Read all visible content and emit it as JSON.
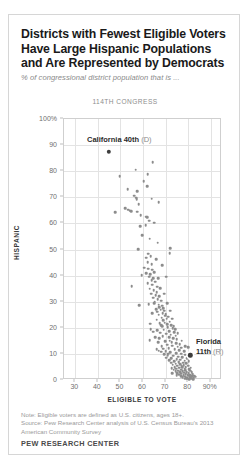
{
  "figure": {
    "title": "Districts with Fewest Eligible Voters Have Large Hispanic Populations and Are Represented by Democrats",
    "subtitle": "% of congressional district population that is ...",
    "panel_label": "114TH CONGRESS",
    "note": "Note: Eligible voters are defined as U.S. citizens, ages 18+.",
    "source": "Source: Pew Research Center analysis of U.S. Census Bureau's 2013 American Community Survey",
    "brand": "PEW RESEARCH CENTER",
    "colors": {
      "dot": "#8c8c8c",
      "highlight_dot": "#3d3d3d",
      "gridline": "#e3e3e3",
      "frame": "#cfcfcf",
      "title_text": "#1a1a1a",
      "muted_text": "#8a8a8a"
    }
  },
  "chart_data": {
    "type": "scatter",
    "title": "Districts with Fewest Eligible Voters Have Large Hispanic Populations and Are Represented by Democrats",
    "subtitle": "% of congressional district population that is ...",
    "panel_label": "114TH CONGRESS",
    "xlabel": "ELIGIBLE TO VOTE",
    "ylabel": "HISPANIC",
    "xlim": [
      25,
      95
    ],
    "ylim": [
      0,
      100
    ],
    "xticks": [
      30,
      40,
      50,
      60,
      70,
      80,
      90
    ],
    "xtick_labels": [
      "30",
      "40",
      "50",
      "60",
      "70",
      "80",
      "90%"
    ],
    "yticks": [
      0,
      10,
      20,
      30,
      40,
      50,
      60,
      70,
      80,
      90,
      100
    ],
    "ytick_labels": [
      "0",
      "10",
      "20",
      "30",
      "40",
      "50",
      "60",
      "70",
      "80",
      "90",
      "100%"
    ],
    "grid": true,
    "legend": null,
    "annotations": [
      {
        "name": "california-40th",
        "label_bold": "California 40th",
        "label_light": "(D)",
        "x": 44.8,
        "y": 87.5
      },
      {
        "name": "florida-11th",
        "label_line1_bold": "Florida",
        "label_line2_bold": "11th",
        "label_line2_light": "(R)",
        "x": 81.0,
        "y": 9.5
      }
    ],
    "points": [
      [
        44.8,
        87.5
      ],
      [
        64.3,
        83.5
      ],
      [
        56.8,
        80.6
      ],
      [
        49.6,
        78.1
      ],
      [
        62.0,
        78.8
      ],
      [
        60.3,
        76.2
      ],
      [
        61.8,
        74.2
      ],
      [
        53.3,
        73.0
      ],
      [
        57.4,
        72.3
      ],
      [
        56.2,
        70.6
      ],
      [
        56.9,
        69.9
      ],
      [
        57.2,
        69.2
      ],
      [
        63.8,
        69.5
      ],
      [
        67.0,
        68.1
      ],
      [
        58.1,
        67.3
      ],
      [
        52.0,
        65.8
      ],
      [
        53.4,
        65.2
      ],
      [
        54.4,
        64.9
      ],
      [
        54.8,
        64.6
      ],
      [
        57.5,
        64.5
      ],
      [
        47.8,
        64.2
      ],
      [
        59.0,
        63.2
      ],
      [
        61.5,
        62.6
      ],
      [
        61.9,
        62.4
      ],
      [
        62.7,
        61.0
      ],
      [
        64.9,
        60.3
      ],
      [
        58.8,
        59.0
      ],
      [
        61.2,
        59.2
      ],
      [
        59.6,
        55.5
      ],
      [
        62.9,
        54.2
      ],
      [
        66.5,
        52.6
      ],
      [
        57.9,
        50.1
      ],
      [
        72.0,
        50.4
      ],
      [
        71.8,
        48.6
      ],
      [
        62.2,
        48.4
      ],
      [
        63.5,
        47.5
      ],
      [
        61.4,
        46.8
      ],
      [
        65.9,
        46.2
      ],
      [
        62.0,
        45.1
      ],
      [
        63.9,
        44.4
      ],
      [
        68.6,
        44.0
      ],
      [
        60.6,
        43.0
      ],
      [
        62.4,
        42.7
      ],
      [
        64.2,
        42.2
      ],
      [
        65.0,
        41.4
      ],
      [
        61.3,
        41.0
      ],
      [
        63.2,
        40.6
      ],
      [
        59.5,
        40.2
      ],
      [
        62.7,
        39.5
      ],
      [
        64.6,
        39.1
      ],
      [
        70.2,
        39.6
      ],
      [
        66.8,
        38.9
      ],
      [
        63.8,
        38.2
      ],
      [
        65.4,
        37.6
      ],
      [
        62.1,
        37.2
      ],
      [
        64.0,
        36.5
      ],
      [
        55.0,
        36.0
      ],
      [
        66.2,
        35.8
      ],
      [
        67.5,
        35.2
      ],
      [
        63.0,
        35.0
      ],
      [
        64.8,
        34.4
      ],
      [
        66.0,
        33.7
      ],
      [
        63.6,
        33.1
      ],
      [
        65.7,
        32.6
      ],
      [
        67.1,
        32.0
      ],
      [
        64.4,
        31.5
      ],
      [
        66.6,
        30.9
      ],
      [
        68.0,
        30.4
      ],
      [
        65.2,
        30.0
      ],
      [
        58.4,
        28.6
      ],
      [
        66.9,
        28.8
      ],
      [
        68.4,
        28.4
      ],
      [
        67.3,
        28.0
      ],
      [
        69.0,
        27.6
      ],
      [
        65.8,
        27.2
      ],
      [
        67.8,
        26.9
      ],
      [
        69.4,
        26.5
      ],
      [
        66.4,
        26.1
      ],
      [
        68.7,
        25.7
      ],
      [
        70.0,
        25.3
      ],
      [
        67.0,
        25.0
      ],
      [
        69.8,
        24.6
      ],
      [
        71.2,
        24.2
      ],
      [
        68.2,
        23.9
      ],
      [
        70.5,
        23.5
      ],
      [
        66.1,
        23.1
      ],
      [
        68.9,
        22.8
      ],
      [
        71.8,
        22.4
      ],
      [
        69.6,
        22.0
      ],
      [
        67.4,
        21.7
      ],
      [
        70.8,
        21.3
      ],
      [
        72.5,
        21.0
      ],
      [
        68.5,
        20.6
      ],
      [
        71.0,
        20.2
      ],
      [
        73.2,
        19.9
      ],
      [
        63.5,
        19.5
      ],
      [
        69.2,
        19.2
      ],
      [
        71.5,
        18.8
      ],
      [
        73.8,
        18.4
      ],
      [
        67.6,
        18.1
      ],
      [
        70.3,
        17.7
      ],
      [
        72.2,
        17.4
      ],
      [
        74.4,
        17.0
      ],
      [
        68.8,
        16.7
      ],
      [
        71.7,
        16.3
      ],
      [
        73.5,
        16.0
      ],
      [
        75.0,
        15.6
      ],
      [
        62.9,
        15.2
      ],
      [
        69.9,
        14.9
      ],
      [
        72.8,
        14.5
      ],
      [
        74.8,
        14.2
      ],
      [
        76.2,
        13.8
      ],
      [
        70.6,
        13.5
      ],
      [
        73.0,
        13.1
      ],
      [
        75.4,
        12.8
      ],
      [
        77.0,
        12.4
      ],
      [
        71.4,
        12.1
      ],
      [
        74.0,
        11.8
      ],
      [
        76.0,
        11.4
      ],
      [
        78.2,
        11.1
      ],
      [
        66.0,
        11.8
      ],
      [
        67.0,
        11.2
      ],
      [
        68.0,
        10.9
      ],
      [
        72.0,
        10.6
      ],
      [
        74.6,
        10.3
      ],
      [
        76.8,
        10.0
      ],
      [
        78.8,
        9.7
      ],
      [
        81.0,
        9.5
      ],
      [
        69.5,
        9.9
      ],
      [
        71.0,
        9.6
      ],
      [
        73.4,
        9.3
      ],
      [
        75.6,
        9.0
      ],
      [
        77.4,
        8.7
      ],
      [
        79.6,
        8.4
      ],
      [
        70.4,
        8.6
      ],
      [
        72.6,
        8.3
      ],
      [
        74.9,
        8.0
      ],
      [
        76.6,
        7.7
      ],
      [
        78.5,
        7.4
      ],
      [
        80.3,
        7.1
      ],
      [
        71.6,
        7.6
      ],
      [
        73.8,
        7.3
      ],
      [
        75.8,
        7.0
      ],
      [
        77.8,
        6.7
      ],
      [
        79.2,
        6.4
      ],
      [
        72.4,
        6.6
      ],
      [
        74.4,
        6.3
      ],
      [
        76.4,
        6.0
      ],
      [
        78.0,
        5.7
      ],
      [
        80.0,
        5.5
      ],
      [
        73.2,
        5.8
      ],
      [
        75.2,
        5.5
      ],
      [
        77.2,
        5.2
      ],
      [
        79.0,
        4.9
      ],
      [
        81.2,
        4.7
      ],
      [
        74.0,
        5.0
      ],
      [
        76.0,
        4.7
      ],
      [
        78.4,
        4.4
      ],
      [
        80.6,
        4.2
      ],
      [
        72.8,
        4.6
      ],
      [
        74.8,
        4.3
      ],
      [
        76.8,
        4.0
      ],
      [
        78.8,
        3.8
      ],
      [
        80.8,
        3.5
      ],
      [
        73.6,
        3.9
      ],
      [
        75.6,
        3.6
      ],
      [
        77.6,
        3.4
      ],
      [
        79.4,
        3.1
      ],
      [
        81.6,
        2.9
      ],
      [
        74.4,
        3.3
      ],
      [
        76.4,
        3.0
      ],
      [
        78.2,
        2.8
      ],
      [
        80.2,
        2.5
      ],
      [
        82.0,
        2.3
      ],
      [
        75.2,
        2.7
      ],
      [
        77.0,
        2.4
      ],
      [
        79.0,
        2.2
      ],
      [
        81.0,
        1.9
      ],
      [
        82.6,
        1.7
      ],
      [
        76.0,
        2.1
      ],
      [
        78.0,
        1.8
      ],
      [
        80.0,
        1.6
      ],
      [
        81.8,
        1.4
      ],
      [
        83.2,
        1.2
      ],
      [
        76.8,
        1.5
      ],
      [
        78.8,
        1.3
      ],
      [
        80.8,
        1.1
      ],
      [
        82.4,
        0.9
      ],
      [
        77.6,
        1.0
      ],
      [
        79.6,
        0.8
      ],
      [
        81.4,
        0.6
      ],
      [
        78.4,
        0.5
      ],
      [
        80.4,
        0.4
      ],
      [
        82.2,
        0.3
      ],
      [
        79.2,
        0.7
      ],
      [
        75.0,
        1.9
      ],
      [
        73.0,
        2.6
      ],
      [
        77.4,
        4.8
      ],
      [
        75.8,
        6.8
      ],
      [
        79.8,
        2.0
      ],
      [
        68.2,
        13.0
      ],
      [
        66.8,
        14.5
      ],
      [
        65.4,
        16.5
      ],
      [
        64.6,
        18.5
      ],
      [
        63.2,
        21.5
      ],
      [
        69.0,
        12.0
      ],
      [
        70.0,
        11.0
      ],
      [
        71.2,
        10.0
      ],
      [
        77.2,
        15.0
      ],
      [
        78.6,
        13.0
      ],
      [
        80.0,
        12.5
      ],
      [
        74.2,
        19.5
      ],
      [
        73.0,
        23.5
      ],
      [
        72.0,
        26.5
      ],
      [
        70.6,
        29.5
      ],
      [
        69.4,
        33.0
      ],
      [
        68.0,
        21.0
      ],
      [
        66.4,
        19.0
      ],
      [
        64.0,
        25.5
      ],
      [
        62.6,
        29.0
      ],
      [
        65.0,
        29.5
      ],
      [
        67.2,
        16.0
      ],
      [
        71.9,
        15.0
      ],
      [
        73.6,
        20.5
      ],
      [
        75.4,
        18.0
      ]
    ]
  }
}
